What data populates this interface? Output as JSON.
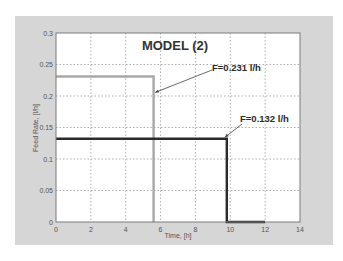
{
  "chart_data": {
    "type": "line",
    "title": "MODEL (2)",
    "xlabel": "Time, [h]",
    "ylabel": "Feed Rate, [l/h]",
    "xlim": [
      0,
      14
    ],
    "ylim": [
      0,
      0.3
    ],
    "xticks": [
      "0",
      "2",
      "4",
      "6",
      "8",
      "10",
      "12",
      "14"
    ],
    "yticks": [
      "0",
      "0.05",
      "0.1",
      "0.15",
      "0.2",
      "0.25",
      "0.3"
    ],
    "grid": true,
    "legend": null,
    "series": [
      {
        "name": "F=0.231 l/h",
        "color": "#a8a8a8",
        "step": true,
        "x": [
          0,
          5.6,
          5.6
        ],
        "y": [
          0.231,
          0.231,
          0
        ]
      },
      {
        "name": "F=0.132 l/h",
        "color": "#2b2b2b",
        "step": true,
        "x": [
          0,
          9.8,
          9.8,
          12
        ],
        "y": [
          0.132,
          0.132,
          0,
          0
        ]
      }
    ],
    "annotations": [
      {
        "text": "F=0.231 l/h",
        "points_to": [
          5.6,
          0.231
        ]
      },
      {
        "text": "F=0.132 l/h",
        "points_to": [
          9.8,
          0.132
        ]
      }
    ]
  },
  "labels": {
    "title": "MODEL (2)",
    "xlabel": "Time, [h]",
    "ylabel": "Feed Rate, [l/h]",
    "ann1": "F=0.231 l/h",
    "ann2": "F=0.132 l/h",
    "xticks": [
      "0",
      "2",
      "4",
      "6",
      "8",
      "10",
      "12",
      "14"
    ],
    "yticks": [
      "0",
      "0.05",
      "0.1",
      "0.15",
      "0.2",
      "0.25",
      "0.3"
    ]
  }
}
